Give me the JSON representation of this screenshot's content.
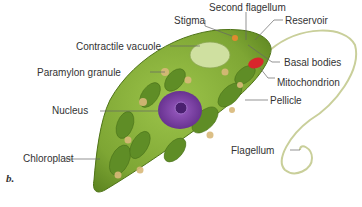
{
  "figure": {
    "panel_letter": "b.",
    "labels": {
      "stigma": "Stigma",
      "second_flagellum": "Second flagellum",
      "reservoir": "Reservoir",
      "contractile_vacuole": "Contractile vacuole",
      "basal_bodies": "Basal bodies",
      "paramylon_granule": "Paramylon granule",
      "mitochondrion": "Mitochondrion",
      "nucleus": "Nucleus",
      "pellicle": "Pellicle",
      "flagellum": "Flagellum",
      "chloroplast": "Chloroplast"
    },
    "colors": {
      "cell_body": "#8fb83c",
      "cell_dark": "#5e8a22",
      "nucleus": "#7a3fa0",
      "mitochondrion": "#d8262c",
      "granule": "#d9b979",
      "flagellum": "#c9cf9a",
      "leader_line": "#666666"
    }
  }
}
